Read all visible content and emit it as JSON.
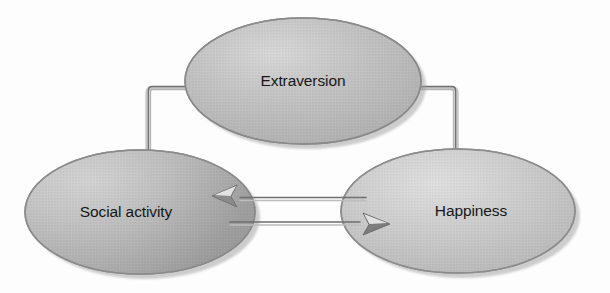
{
  "diagram": {
    "background_color": "#fdfdfd",
    "nodes": [
      {
        "id": "extraversion",
        "label": "Extraversion",
        "shape": "ellipse",
        "cx": 303,
        "cy": 81,
        "rx": 118,
        "ry": 63,
        "fill": "#b9b9b9",
        "fill_light": "#d2d2d2",
        "stroke": "#8a8a8a",
        "shadow": "#9a9a9a",
        "label_x": 303,
        "label_y": 82
      },
      {
        "id": "social-activity",
        "label": "Social activity",
        "shape": "ellipse",
        "cx": 140,
        "cy": 212,
        "rx": 115,
        "ry": 62,
        "fill": "#b5b5b5",
        "fill_light": "#d4d4d4",
        "stroke": "#8a8a8a",
        "shadow": "#9a9a9a",
        "label_x": 126,
        "label_y": 213
      },
      {
        "id": "happiness",
        "label": "Happiness",
        "shape": "ellipse",
        "cx": 458,
        "cy": 211,
        "rx": 117,
        "ry": 62,
        "fill": "#c3c3c3",
        "fill_light": "#dcdcdc",
        "stroke": "#8c8c8c",
        "shadow": "#9c9c9c",
        "label_x": 471,
        "label_y": 212
      }
    ],
    "edges": [
      {
        "id": "extraversion-to-social-activity",
        "from": "extraversion",
        "to": "social-activity",
        "style": "elbow",
        "direction": "down-left",
        "arrow": "single",
        "stroke": "#7e7e7e"
      },
      {
        "id": "extraversion-to-happiness",
        "from": "extraversion",
        "to": "happiness",
        "style": "elbow",
        "direction": "down-right",
        "arrow": "single",
        "stroke": "#7e7e7e"
      },
      {
        "id": "happiness-to-social-activity",
        "from": "happiness",
        "to": "social-activity",
        "style": "straight",
        "direction": "left",
        "arrow": "single",
        "stroke": "#7e7e7e"
      },
      {
        "id": "social-activity-to-happiness",
        "from": "social-activity",
        "to": "happiness",
        "style": "straight",
        "direction": "right",
        "arrow": "single",
        "stroke": "#7e7e7e"
      }
    ]
  }
}
